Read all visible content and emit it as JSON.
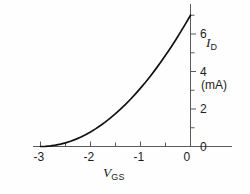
{
  "figure": {
    "background_color": "#fefefe",
    "curve_color": "#111111",
    "axis_color": "#555555"
  },
  "axes": {
    "x": {
      "title_var": "V",
      "title_sub": "GS",
      "tick_labels": [
        "-3",
        "-2",
        "-1",
        "0"
      ],
      "tick_values": [
        -3,
        -2,
        -1,
        0
      ],
      "minor_tick_values": [
        -2.5,
        -1.5,
        -0.5
      ],
      "range": [
        -3.15,
        0
      ]
    },
    "y": {
      "title_var": "I",
      "title_sub": "D",
      "unit_label": "(mA)",
      "tick_labels": [
        "0",
        "2",
        "4",
        "6"
      ],
      "tick_values": [
        0,
        2,
        4,
        6
      ],
      "minor_tick_values": [
        1,
        3,
        5,
        7
      ],
      "range": [
        0,
        7.6
      ]
    }
  },
  "chart_data": {
    "type": "line",
    "title": "",
    "subtitle": "",
    "xlabel": "V_GS",
    "ylabel": "I_D (mA)",
    "xlim": [
      -3.15,
      0
    ],
    "ylim": [
      0,
      7.6
    ],
    "grid": false,
    "legend": "none",
    "annotations": [],
    "series": [
      {
        "name": "JFET transfer characteristic",
        "equation": "I_D = I_DSS * (1 - V_GS/V_P)^2, I_DSS = 7 mA, V_P = -3 V",
        "x": [
          -3.0,
          -2.9,
          -2.8,
          -2.7,
          -2.6,
          -2.5,
          -2.4,
          -2.3,
          -2.2,
          -2.1,
          -2.0,
          -1.9,
          -1.8,
          -1.7,
          -1.6,
          -1.5,
          -1.4,
          -1.3,
          -1.2,
          -1.1,
          -1.0,
          -0.9,
          -0.8,
          -0.7,
          -0.6,
          -0.5,
          -0.4,
          -0.3,
          -0.2,
          -0.1,
          0.0
        ],
        "y": [
          0.0,
          0.008,
          0.031,
          0.07,
          0.124,
          0.194,
          0.28,
          0.381,
          0.498,
          0.63,
          0.778,
          0.941,
          1.12,
          1.315,
          1.524,
          1.75,
          1.991,
          2.247,
          2.519,
          2.807,
          3.111,
          3.43,
          3.764,
          4.114,
          4.48,
          4.861,
          5.258,
          5.671,
          6.098,
          6.542,
          7.0
        ]
      }
    ]
  }
}
